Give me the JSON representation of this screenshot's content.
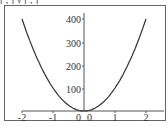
{
  "header": {
    "text": "[ , ] y [ , ]"
  },
  "chart_data": {
    "type": "line",
    "title": "",
    "xlabel": "",
    "ylabel": "",
    "xlim": [
      -2,
      2
    ],
    "ylim": [
      0,
      400
    ],
    "x_ticks": [
      "-2",
      "-1",
      "0",
      "1",
      "2"
    ],
    "y_ticks": [
      "0",
      "100",
      "200",
      "300",
      "400"
    ],
    "grid": false,
    "legend": null,
    "series": [
      {
        "name": "y = 100x^2",
        "x": [
          -2,
          -1.5,
          -1,
          -0.5,
          0,
          0.5,
          1,
          1.5,
          2
        ],
        "y": [
          400,
          225,
          100,
          25,
          0,
          25,
          100,
          225,
          400
        ]
      }
    ]
  }
}
